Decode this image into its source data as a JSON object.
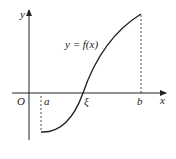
{
  "diagram": {
    "axis_labels": {
      "x": "x",
      "y": "y",
      "origin": "O"
    },
    "points": {
      "a": "a",
      "xi": "ξ",
      "b": "b"
    },
    "curve_label": "y = f(x)",
    "colors": {
      "stroke": "#222222",
      "background": "#ffffff"
    }
  }
}
